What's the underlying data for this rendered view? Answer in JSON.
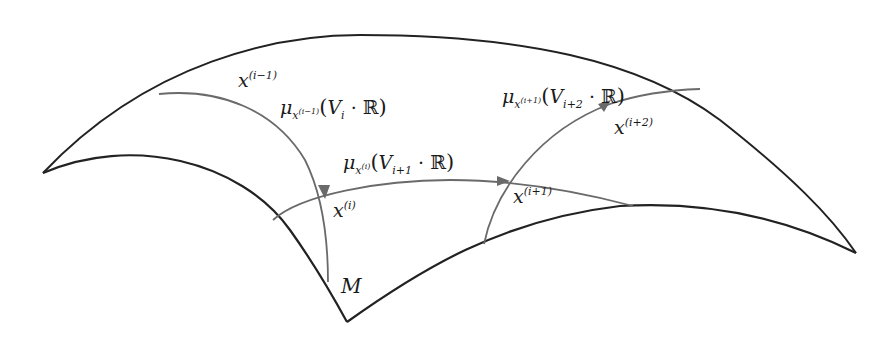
{
  "diagram": {
    "manifold_label": "M",
    "points": [
      {
        "id": "x_i_minus_1",
        "base": "x",
        "superscript": "(i−1)"
      },
      {
        "id": "x_i",
        "base": "x",
        "superscript": "(i)"
      },
      {
        "id": "x_i_plus_1",
        "base": "x",
        "superscript": "(i+1)"
      },
      {
        "id": "x_i_plus_2",
        "base": "x",
        "superscript": "(i+2)"
      }
    ],
    "curves": [
      {
        "id": "mu1",
        "mu": "μ",
        "sub_base": "x",
        "sub_sup": "(i−1)",
        "open": "(",
        "V": "V",
        "V_sub": "i",
        "dot": "·",
        "R": "ℝ",
        "close": ")"
      },
      {
        "id": "mu2",
        "mu": "μ",
        "sub_base": "x",
        "sub_sup": "(i)",
        "open": "(",
        "V": "V",
        "V_sub": "i+1",
        "dot": "·",
        "R": "ℝ",
        "close": ")"
      },
      {
        "id": "mu3",
        "mu": "μ",
        "sub_base": "x",
        "sub_sup": "(i+1)",
        "open": "(",
        "V": "V",
        "V_sub": "i+2",
        "dot": "·",
        "R": "ℝ",
        "close": ")"
      }
    ],
    "colors": {
      "surface_edge": "#222222",
      "geodesic": "#6a6a6a",
      "arrow": "#6a6a6a",
      "text": "#1a1a1a"
    }
  }
}
